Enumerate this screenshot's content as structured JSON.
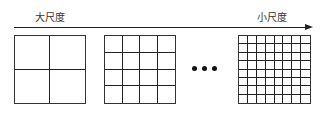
{
  "diagram": {
    "arrow": {
      "start_label": "大尺度",
      "end_label": "小尺度"
    },
    "grids": [
      {
        "rows": 2,
        "cols": 2
      },
      {
        "rows": 4,
        "cols": 4
      },
      {
        "rows": 8,
        "cols": 8
      }
    ],
    "ellipsis": "•••"
  }
}
